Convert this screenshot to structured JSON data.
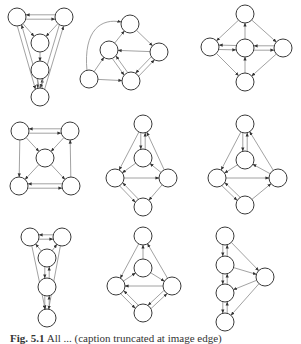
{
  "figure": {
    "caption_label": "Fig. 5.1",
    "caption_text": "All ... (caption truncated at image edge)",
    "colors": {
      "edge": "#8a8a8a",
      "node_stroke": "#3a3a3a",
      "node_fill": "#ffffff",
      "arrow": "#333333"
    },
    "node_radius": 9,
    "graphs": [
      {
        "id": "g1",
        "nodes": [
          [
            17,
            17
          ],
          [
            64,
            17
          ],
          [
            40,
            43
          ],
          [
            40,
            70
          ],
          [
            40,
            97
          ]
        ],
        "edges": [
          [
            0,
            1
          ],
          [
            1,
            0
          ],
          [
            0,
            2
          ],
          [
            1,
            2
          ],
          [
            2,
            3
          ],
          [
            3,
            4
          ],
          [
            4,
            3
          ],
          [
            0,
            4
          ],
          [
            4,
            0
          ],
          [
            1,
            4
          ],
          [
            4,
            1
          ]
        ]
      },
      {
        "id": "g2",
        "nodes": [
          [
            130,
            24
          ],
          [
            109,
            50
          ],
          [
            159,
            52
          ],
          [
            89,
            79
          ],
          [
            131,
            81
          ]
        ],
        "edges": [
          [
            1,
            0
          ],
          [
            0,
            2
          ],
          [
            2,
            1
          ],
          [
            3,
            1
          ],
          [
            3,
            4
          ],
          [
            1,
            4
          ],
          [
            4,
            1
          ],
          [
            4,
            2
          ],
          [
            2,
            4
          ]
        ],
        "curved": [
          [
            3,
            0
          ]
        ]
      },
      {
        "id": "g3",
        "nodes": [
          [
            245,
            14
          ],
          [
            210,
            47
          ],
          [
            245,
            48
          ],
          [
            283,
            48
          ],
          [
            245,
            82
          ]
        ],
        "edges": [
          [
            0,
            1
          ],
          [
            0,
            3
          ],
          [
            2,
            0
          ],
          [
            1,
            2
          ],
          [
            2,
            1
          ],
          [
            2,
            3
          ],
          [
            3,
            2
          ],
          [
            1,
            4
          ],
          [
            3,
            4
          ],
          [
            4,
            2
          ]
        ]
      },
      {
        "id": "g4",
        "nodes": [
          [
            20,
            131
          ],
          [
            70,
            131
          ],
          [
            45,
            158
          ],
          [
            19,
            186
          ],
          [
            71,
            186
          ]
        ],
        "edges": [
          [
            0,
            1
          ],
          [
            1,
            0
          ],
          [
            0,
            2
          ],
          [
            1,
            2
          ],
          [
            0,
            3
          ],
          [
            2,
            3
          ],
          [
            2,
            4
          ],
          [
            3,
            4
          ],
          [
            4,
            3
          ],
          [
            4,
            1
          ]
        ]
      },
      {
        "id": "g5",
        "nodes": [
          [
            143,
            124
          ],
          [
            143,
            158
          ],
          [
            115,
            178
          ],
          [
            168,
            178
          ],
          [
            143,
            207
          ]
        ],
        "edges": [
          [
            0,
            1
          ],
          [
            1,
            0
          ],
          [
            0,
            2
          ],
          [
            3,
            0
          ],
          [
            1,
            2
          ],
          [
            2,
            3
          ],
          [
            3,
            1
          ],
          [
            2,
            4
          ],
          [
            4,
            2
          ],
          [
            3,
            4
          ]
        ]
      },
      {
        "id": "g6",
        "nodes": [
          [
            245,
            124
          ],
          [
            245,
            160
          ],
          [
            217,
            178
          ],
          [
            278,
            178
          ],
          [
            245,
            205
          ]
        ],
        "edges": [
          [
            0,
            1
          ],
          [
            1,
            0
          ],
          [
            0,
            2
          ],
          [
            3,
            0
          ],
          [
            1,
            2
          ],
          [
            2,
            3
          ],
          [
            3,
            1
          ],
          [
            2,
            4
          ],
          [
            4,
            2
          ],
          [
            4,
            3
          ]
        ]
      },
      {
        "id": "g7",
        "nodes": [
          [
            30,
            237
          ],
          [
            62,
            237
          ],
          [
            47,
            258
          ],
          [
            47,
            287
          ],
          [
            47,
            318
          ]
        ],
        "edges": [
          [
            0,
            1
          ],
          [
            1,
            0
          ],
          [
            2,
            0
          ],
          [
            2,
            1
          ],
          [
            2,
            3
          ],
          [
            3,
            2
          ],
          [
            3,
            4
          ],
          [
            4,
            3
          ],
          [
            0,
            4
          ],
          [
            1,
            4
          ]
        ]
      },
      {
        "id": "g8",
        "nodes": [
          [
            143,
            236
          ],
          [
            143,
            268
          ],
          [
            116,
            286
          ],
          [
            172,
            286
          ],
          [
            143,
            313
          ]
        ],
        "edges": [
          [
            0,
            2
          ],
          [
            1,
            0
          ],
          [
            2,
            1
          ],
          [
            1,
            3
          ],
          [
            3,
            2
          ],
          [
            3,
            0
          ],
          [
            2,
            4
          ],
          [
            4,
            2
          ],
          [
            4,
            3
          ],
          [
            3,
            4
          ]
        ]
      },
      {
        "id": "g9",
        "nodes": [
          [
            225,
            236
          ],
          [
            225,
            265
          ],
          [
            265,
            277
          ],
          [
            225,
            293
          ],
          [
            225,
            322
          ]
        ],
        "edges": [
          [
            0,
            1
          ],
          [
            1,
            0
          ],
          [
            0,
            2
          ],
          [
            1,
            2
          ],
          [
            1,
            3
          ],
          [
            3,
            1
          ],
          [
            2,
            3
          ],
          [
            3,
            4
          ],
          [
            4,
            3
          ],
          [
            2,
            4
          ]
        ]
      }
    ]
  }
}
